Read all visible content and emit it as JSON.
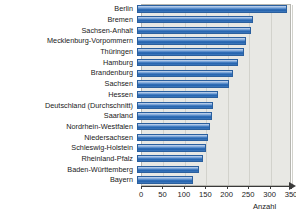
{
  "chart_data": {
    "type": "bar",
    "orientation": "horizontal",
    "title": "",
    "subtitle": "",
    "xlabel": "Anzahl",
    "ylabel": "",
    "xlim": [
      0,
      350
    ],
    "ylim": null,
    "grid": true,
    "grid_axis": "x",
    "legend": null,
    "legend_position": "none",
    "bar_color": "#2f6cb5",
    "plot_background": "#e8e8e4",
    "xticks": [
      0,
      50,
      100,
      150,
      200,
      250,
      300,
      350
    ],
    "xtick_labels": [
      "0",
      "50",
      "100",
      "150",
      "200",
      "250",
      "300",
      "350"
    ],
    "categories": [
      "Berlin",
      "Bremen",
      "Sachsen-Anhalt",
      "Mecklenburg-Vorpommern",
      "Thüringen",
      "Hamburg",
      "Brandenburg",
      "Sachsen",
      "Hessen",
      "Deutschland (Durchschnitt)",
      "Saarland",
      "Nordrhein-Westfalen",
      "Niedersachsen",
      "Schleswig-Holstein",
      "Rheinland-Pfalz",
      "Baden-Württemberg",
      "Bayern"
    ],
    "values": [
      350,
      270,
      265,
      255,
      250,
      235,
      225,
      215,
      190,
      177,
      175,
      170,
      165,
      160,
      155,
      145,
      130
    ]
  }
}
